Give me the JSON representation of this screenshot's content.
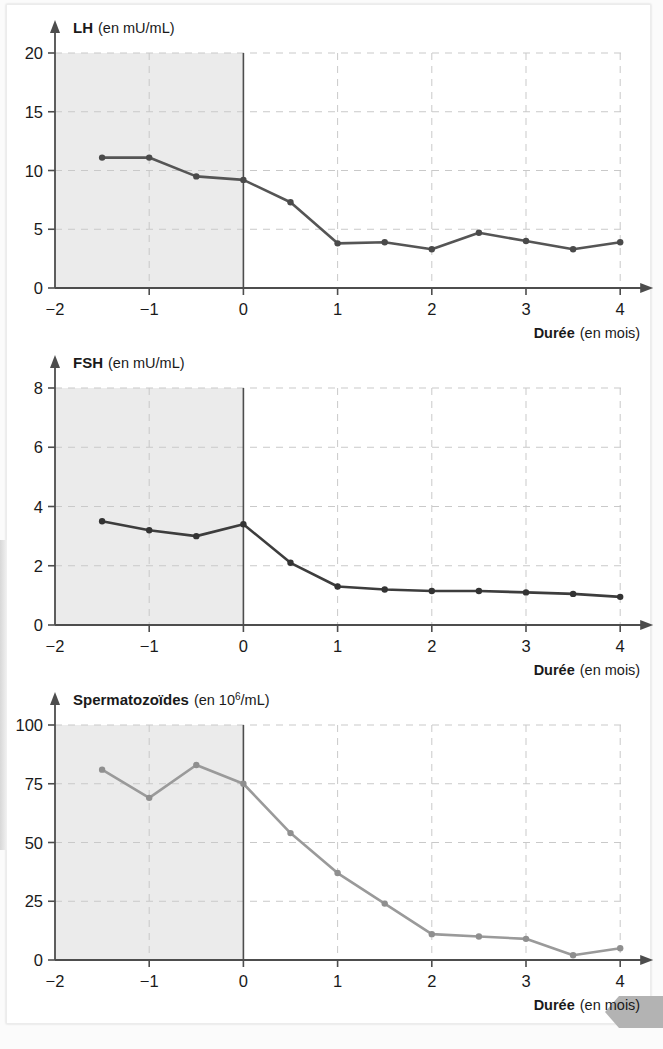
{
  "page": {
    "background_color": "#ffffff",
    "corner_tab_color": "#b3b3b3"
  },
  "axis_common": {
    "x_label_bold": "Durée",
    "x_label_rest": "(en mois)",
    "x_ticks": [
      "−2",
      "−1",
      "0",
      "1",
      "2",
      "3",
      "4"
    ],
    "x_tick_values": [
      -2,
      -1,
      0,
      1,
      2,
      3,
      4
    ],
    "shaded_region_color": "#ebebeb",
    "shaded_region_from": -2,
    "shaded_region_to": 0,
    "grid_color": "#c9c9c9",
    "axis_color": "#4d4d4d"
  },
  "chart_data": [
    {
      "id": "lh",
      "type": "line",
      "title_bold": "LH",
      "title_rest": "(en mU/mL)",
      "title": "LH (en mU/mL)",
      "xlabel": "Durée (en mois)",
      "ylabel": "LH (en mU/mL)",
      "xlim": [
        -2,
        4
      ],
      "ylim": [
        0,
        20
      ],
      "y_ticks": [
        "0",
        "5",
        "10",
        "15",
        "20"
      ],
      "y_tick_values": [
        0,
        5,
        10,
        15,
        20
      ],
      "grid": true,
      "legend": "none",
      "series_color": "#555555",
      "marker_color": "#4a4a4a",
      "x": [
        -1.5,
        -1,
        -0.5,
        0,
        0.5,
        1,
        1.5,
        2,
        2.5,
        3,
        3.5,
        4
      ],
      "values": [
        11.1,
        11.1,
        9.5,
        9.2,
        7.3,
        3.8,
        3.9,
        3.3,
        4.7,
        4.0,
        3.3,
        3.9
      ]
    },
    {
      "id": "fsh",
      "type": "line",
      "title_bold": "FSH",
      "title_rest": "(en mU/mL)",
      "title": "FSH (en mU/mL)",
      "xlabel": "Durée (en mois)",
      "ylabel": "FSH (en mU/mL)",
      "xlim": [
        -2,
        4
      ],
      "ylim": [
        0,
        8
      ],
      "y_ticks": [
        "0",
        "2",
        "4",
        "6",
        "8"
      ],
      "y_tick_values": [
        0,
        2,
        4,
        6,
        8
      ],
      "grid": true,
      "legend": "none",
      "series_color": "#3d3d3d",
      "marker_color": "#333333",
      "x": [
        -1.5,
        -1,
        -0.5,
        0,
        0.5,
        1,
        1.5,
        2,
        2.5,
        3,
        3.5,
        4
      ],
      "values": [
        3.5,
        3.2,
        3.0,
        3.4,
        2.1,
        1.3,
        1.2,
        1.15,
        1.15,
        1.1,
        1.05,
        0.95
      ]
    },
    {
      "id": "spz",
      "type": "line",
      "title_bold": "Spermatozoïdes",
      "title_rest": "(en 10⁶/mL)",
      "title_rest_base": "(en 10",
      "title_rest_sup": "6",
      "title_rest_tail": "/mL)",
      "title": "Spermatozoïdes (en 10⁶/mL)",
      "xlabel": "Durée (en mois)",
      "ylabel": "Spermatozoïdes (en 10⁶/mL)",
      "xlim": [
        -2,
        4
      ],
      "ylim": [
        0,
        100
      ],
      "y_ticks": [
        "0",
        "25",
        "50",
        "75",
        "100"
      ],
      "y_tick_values": [
        0,
        25,
        50,
        75,
        100
      ],
      "grid": true,
      "legend": "none",
      "series_color": "#9a9a9a",
      "marker_color": "#8f8f8f",
      "x": [
        -1.5,
        -1,
        -0.5,
        0,
        0.5,
        1,
        1.5,
        2,
        2.5,
        3,
        3.5,
        4
      ],
      "values": [
        81,
        69,
        83,
        75,
        54,
        37,
        24,
        11,
        10,
        9,
        2,
        5
      ]
    }
  ]
}
